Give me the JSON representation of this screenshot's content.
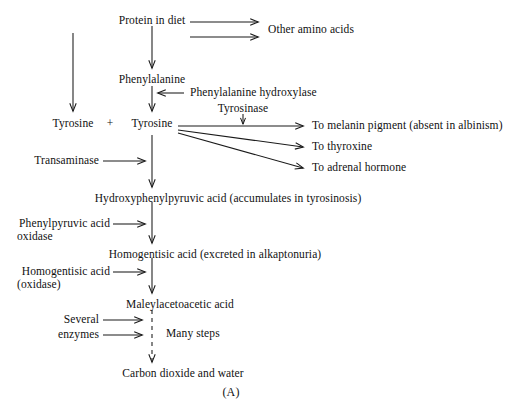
{
  "figure": {
    "panel_label": "(A)",
    "title_text": "Phenylalanine and tyrosine metabolic pathway",
    "background_color": "#ffffff",
    "line_color": "#1a1a1a",
    "text_color": "#111111"
  },
  "nodes": {
    "protein_in_diet": "Protein in diet",
    "other_amino_acids": "Other amino acids",
    "phenylalanine": "Phenylalanine",
    "tyrosine_left": "Tyrosine",
    "plus_sign": "+",
    "tyrosine_right": "Tyrosine",
    "hydroxyphenylpyruvic_acid": "Hydroxyphenylpyruvic acid  (accumulates in tyrosinosis)",
    "homogentisic_acid": "Homogentisic acid  (excreted in alkaptonuria)",
    "maleylacetoacetic_acid": "Maleylacetoacetic acid",
    "carbon_dioxide_and_water": "Carbon dioxide and water",
    "to_melanin_pigment": "To melanin pigment  (absent in albinism)",
    "to_thyroxine": "To thyroxine",
    "to_adrenal_hormone": "To adrenal hormone"
  },
  "enzymes": {
    "phenylalanine_hydroxylase": "Phenylalanine hydroxylase",
    "tyrosinase": "Tyrosinase",
    "transaminase": "Transaminase",
    "phenylpyruvic_acid_oxidase_line1": "Phenylpyruvic acid",
    "phenylpyruvic_acid_oxidase_line2": "oxidase",
    "homogentisic_acid_oxidase_line1": "Homogentisic acid",
    "homogentisic_acid_oxidase_line2": "(oxidase)",
    "several_enzymes_line1": "Several",
    "several_enzymes_line2": "enzymes"
  },
  "annotations": {
    "many_steps": "Many steps"
  },
  "arrows": [
    {
      "name": "protein-to-other-amino-acids-upper",
      "style": "solid",
      "direction": "right"
    },
    {
      "name": "protein-to-other-amino-acids-lower",
      "style": "solid",
      "direction": "right"
    },
    {
      "name": "protein-to-tyrosine-left",
      "style": "solid",
      "direction": "down"
    },
    {
      "name": "protein-to-phenylalanine",
      "style": "solid",
      "direction": "down"
    },
    {
      "name": "phenylalanine-to-tyrosine",
      "style": "solid",
      "direction": "down"
    },
    {
      "name": "phenylalanine-hydroxylase-inhibitor",
      "style": "solid",
      "direction": "left"
    },
    {
      "name": "tyrosinase-marker",
      "style": "solid",
      "direction": "down"
    },
    {
      "name": "tyrosine-to-melanin",
      "style": "solid",
      "direction": "right"
    },
    {
      "name": "tyrosine-to-thyroxine",
      "style": "solid",
      "direction": "right"
    },
    {
      "name": "tyrosine-to-adrenal-hormone",
      "style": "solid",
      "direction": "right"
    },
    {
      "name": "transaminase-arrow",
      "style": "solid",
      "direction": "right"
    },
    {
      "name": "tyrosine-to-hydroxyphenylpyruvic",
      "style": "solid",
      "direction": "down"
    },
    {
      "name": "phenylpyruvic-oxidase-arrow",
      "style": "solid",
      "direction": "right"
    },
    {
      "name": "hydroxyphenylpyruvic-to-homogentisic",
      "style": "solid",
      "direction": "down"
    },
    {
      "name": "homogentisic-oxidase-arrow",
      "style": "solid",
      "direction": "right"
    },
    {
      "name": "homogentisic-to-maleylacetoacetic",
      "style": "solid",
      "direction": "down"
    },
    {
      "name": "several-enzymes-arrow-upper",
      "style": "solid",
      "direction": "right"
    },
    {
      "name": "several-enzymes-arrow-lower",
      "style": "solid",
      "direction": "right"
    },
    {
      "name": "maleylacetoacetic-to-co2-water",
      "style": "dashed",
      "direction": "down"
    }
  ]
}
